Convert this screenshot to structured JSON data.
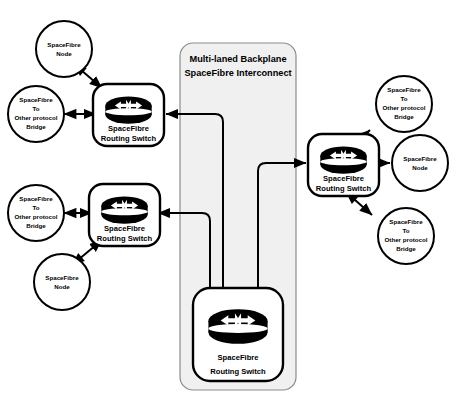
{
  "diagram": {
    "panel": {
      "title_line1": "Multi-laned Backplane",
      "title_line2": "SpaceFibre Interconnect",
      "fill_color": "#f0f0f0",
      "border_color": "#8c8c8c"
    },
    "colors": {
      "stroke": "#000000",
      "background": "#ffffff",
      "icon_fill": "#000000"
    },
    "switches": [
      {
        "id": "switch-top-left",
        "label_line1": "SpaceFibre",
        "label_line2": "Routing Switch",
        "icon": "router-icon"
      },
      {
        "id": "switch-middle-left",
        "label_line1": "SpaceFibre",
        "label_line2": "Routing Switch",
        "icon": "router-icon"
      },
      {
        "id": "switch-right",
        "label_line1": "SpaceFibre",
        "label_line2": "Routing Switch",
        "icon": "router-icon"
      },
      {
        "id": "switch-backplane-bottom",
        "label_line1": "SpaceFibre",
        "label_line2": "Routing Switch",
        "icon": "router-icon"
      }
    ],
    "endpoints": [
      {
        "id": "node-top-left",
        "type": "node",
        "lines": [
          "SpaceFibre",
          "Node"
        ]
      },
      {
        "id": "bridge-left-upper",
        "type": "bridge",
        "lines": [
          "SpaceFibre",
          "To",
          "Other protocol",
          "Bridge"
        ]
      },
      {
        "id": "bridge-left-lower",
        "type": "bridge",
        "lines": [
          "SpaceFibre",
          "To",
          "Other protocol",
          "Bridge"
        ]
      },
      {
        "id": "node-bottom-left",
        "type": "node",
        "lines": [
          "SpaceFibre",
          "Node"
        ]
      },
      {
        "id": "bridge-right-upper",
        "type": "bridge",
        "lines": [
          "SpaceFibre",
          "To",
          "Other protocol",
          "Bridge"
        ]
      },
      {
        "id": "node-right",
        "type": "node",
        "lines": [
          "SpaceFibre",
          "Node"
        ]
      },
      {
        "id": "bridge-right-lower",
        "type": "bridge",
        "lines": [
          "SpaceFibre",
          "To",
          "Other protocol",
          "Bridge"
        ]
      }
    ],
    "links": [
      {
        "id": "link-node-topleft",
        "from": "node-top-left",
        "to": "switch-top-left",
        "arrows": "both"
      },
      {
        "id": "link-bridge-leftupper",
        "from": "bridge-left-upper",
        "to": "switch-top-left",
        "arrows": "both"
      },
      {
        "id": "link-bridge-leftlower",
        "from": "bridge-left-lower",
        "to": "switch-middle-left",
        "arrows": "both"
      },
      {
        "id": "link-node-bottomleft",
        "from": "node-bottom-left",
        "to": "switch-middle-left",
        "arrows": "both"
      },
      {
        "id": "link-bridge-rightupper",
        "from": "bridge-right-upper",
        "to": "switch-right",
        "arrows": "both"
      },
      {
        "id": "link-node-right",
        "from": "node-right",
        "to": "switch-right",
        "arrows": "both"
      },
      {
        "id": "link-bridge-rightlower",
        "from": "bridge-right-lower",
        "to": "switch-right",
        "arrows": "both"
      },
      {
        "id": "link-backplane-topleft",
        "from": "switch-backplane-bottom",
        "to": "switch-top-left",
        "arrows": "both"
      },
      {
        "id": "link-backplane-middleleft",
        "from": "switch-backplane-bottom",
        "to": "switch-middle-left",
        "arrows": "both"
      },
      {
        "id": "link-backplane-right",
        "from": "switch-backplane-bottom",
        "to": "switch-right",
        "arrows": "both"
      }
    ]
  }
}
